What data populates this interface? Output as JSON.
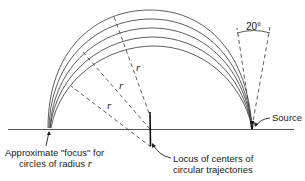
{
  "diagram": {
    "title": "",
    "type": "circular trajectories focusing diagram",
    "colors": {
      "line": "#2a2a2a",
      "background": "#ffffff"
    },
    "labels": {
      "angle": "20°",
      "source": "Source",
      "focus_line1": "Approximate \"focus\" for",
      "focus_line2_prefix": "circles of radius ",
      "focus_line2_var": "r",
      "locus_line1": "Locus of centers of",
      "locus_line2": "circular trajectories",
      "radius_labels": [
        "r",
        "r",
        "r"
      ]
    },
    "elements": {
      "arcs_count": 5,
      "wedge_angle_deg": 20,
      "dashed_radii_count": 3
    }
  }
}
